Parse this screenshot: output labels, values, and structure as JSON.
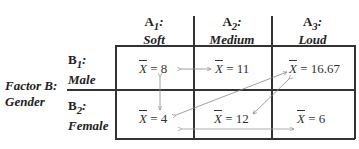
{
  "factor_a": {
    "levels": [
      {
        "code": "A",
        "sub": "1",
        "label": "Soft"
      },
      {
        "code": "A",
        "sub": "2",
        "label": "Medium"
      },
      {
        "code": "A",
        "sub": "3",
        "label": "Loud"
      }
    ]
  },
  "factor_b": {
    "title_line1": "Factor B:",
    "title_line2": "Gender",
    "levels": [
      {
        "code": "B",
        "sub": "1",
        "label": "Male"
      },
      {
        "code": "B",
        "sub": "2",
        "label": "Female"
      }
    ]
  },
  "cells": {
    "b1a1": {
      "sym": "X",
      "eq": " = 8"
    },
    "b1a2": {
      "sym": "X",
      "eq": " = 11"
    },
    "b1a3": {
      "sym": "X",
      "eq": " = 16.67"
    },
    "b2a1": {
      "sym": "X",
      "eq": " = 4"
    },
    "b2a2": {
      "sym": "X",
      "eq": " = 12"
    },
    "b2a3": {
      "sym": "X",
      "eq": " = 6"
    }
  },
  "colors": {
    "grid": "#333333",
    "arrow": "#888888"
  }
}
